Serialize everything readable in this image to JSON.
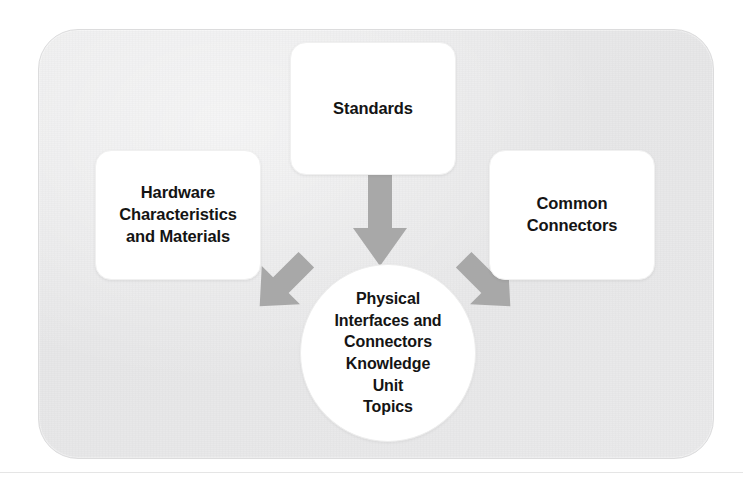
{
  "diagram": {
    "title": "Physical Interfaces and Connectors Knowledge Unit Topics",
    "type": "concept-map",
    "panel": {
      "background_color": "#eaeaeb",
      "border_radius_px": 40
    },
    "center_node": {
      "shape": "ellipse",
      "fill_color": "#ffffff",
      "lines": [
        "Physical",
        "Interfaces and",
        "Connectors",
        "Knowledge",
        "Unit",
        "Topics"
      ],
      "text": "Physical Interfaces and Connectors Knowledge Unit Topics"
    },
    "nodes": [
      {
        "id": "standards",
        "shape": "rounded-rect",
        "fill_color": "#ffffff",
        "position": "top",
        "lines": [
          "Standards"
        ],
        "text": "Standards"
      },
      {
        "id": "hardware",
        "shape": "rounded-rect",
        "fill_color": "#ffffff",
        "position": "left",
        "lines": [
          "Hardware",
          "Characteristics",
          "and Materials"
        ],
        "text": "Hardware Characteristics and Materials"
      },
      {
        "id": "connectors",
        "shape": "rounded-rect",
        "fill_color": "#ffffff",
        "position": "right",
        "lines": [
          "Common",
          "Connectors"
        ],
        "text": "Common Connectors"
      }
    ],
    "arrows": [
      {
        "id": "standards-to-center",
        "from": "standards",
        "to": "center_node",
        "direction": "down",
        "color": "#a8a8a8"
      },
      {
        "id": "hardware-to-center",
        "from": "hardware",
        "to": "center_node",
        "direction": "down-right",
        "color": "#a8a8a8"
      },
      {
        "id": "connectors-to-center",
        "from": "connectors",
        "to": "center_node",
        "direction": "down-left",
        "color": "#a8a8a8"
      }
    ],
    "ghost_text": {
      "note": "faint bleed-through from the facing printed page",
      "lines": [
        "and supported by",
        "of Materials",
        "ad protocol",
        "in the structure"
      ]
    }
  }
}
